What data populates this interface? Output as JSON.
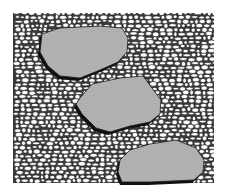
{
  "illustration": {
    "subject": "stepping stones set in a pebble bed",
    "background_color": "#ffffff",
    "ink_color": "#1a1a1a",
    "pebble_fill": "#ffffff",
    "stone_fill": "#b8b8b8",
    "stone_dot_color": "#6a6a6a",
    "shadow_color": "#111111",
    "bed": {
      "x": 13,
      "y": 13,
      "width": 201,
      "height": 170
    },
    "stones": [
      {
        "name": "stepping-stone-1",
        "points": "42,34 60,28 100,26 122,28 128,38 127,52 118,62 100,70 80,78 60,76 48,66 40,52"
      },
      {
        "name": "stepping-stone-2",
        "points": "80,98 92,84 120,78 143,76 152,88 161,100 160,114 150,122 130,126 110,132 96,128 82,114 76,104"
      },
      {
        "name": "stepping-stone-3",
        "points": "120,160 130,150 150,144 176,140 196,148 204,160 203,172 194,180 150,182 122,182 118,172"
      }
    ]
  }
}
